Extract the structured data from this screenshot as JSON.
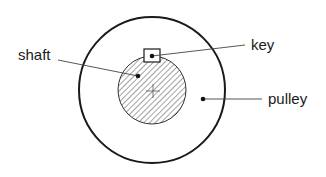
{
  "diagram": {
    "labels": {
      "shaft": "shaft",
      "key": "key",
      "pulley": "pulley"
    },
    "colors": {
      "stroke": "#1a1a1a",
      "hatch": "#555555",
      "background": "#ffffff"
    }
  }
}
